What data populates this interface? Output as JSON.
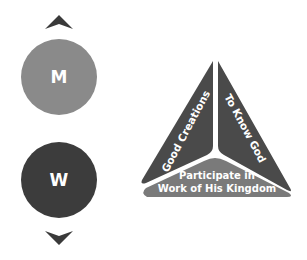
{
  "colors": {
    "background": "#ffffff",
    "circle_m": "#8a8a8a",
    "circle_w": "#3c3c3c",
    "chevron": "#3a3a3a",
    "panel_left": "#4a4a4a",
    "panel_right": "#4a4a4a",
    "panel_bottom": "#7a7a7a",
    "panel_text": "#ffffff"
  },
  "selector": {
    "up_icon": "chevron-up",
    "down_icon": "chevron-down",
    "options": [
      {
        "label": "M",
        "state": "light"
      },
      {
        "label": "W",
        "state": "dark"
      }
    ]
  },
  "triangle": {
    "panels": [
      {
        "id": "left",
        "label": "Good Creations"
      },
      {
        "id": "right",
        "label": "To Know God"
      },
      {
        "id": "bottom",
        "label_line1": "Participate in",
        "label_line2": "Work of His Kingdom"
      }
    ]
  }
}
